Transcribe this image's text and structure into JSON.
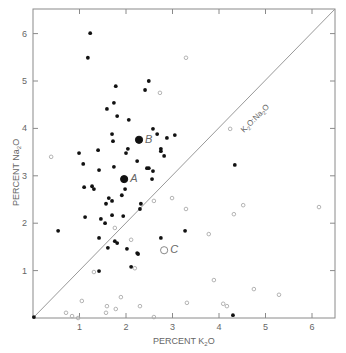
{
  "chart_data": {
    "type": "scatter",
    "title": "",
    "xlabel": "PERCENT  K2O",
    "ylabel": "PERCENT  Na2O",
    "xlabel_main": "PERCENT  K",
    "xlabel_sub": "2",
    "xlabel_end": "O",
    "ylabel_main": "PERCENT  Na",
    "ylabel_sub": "2",
    "ylabel_end": "O",
    "xlim": [
      0,
      6.5
    ],
    "ylim": [
      0,
      6.45
    ],
    "xticks": [
      1,
      2,
      3,
      4,
      5,
      6
    ],
    "yticks": [
      1,
      2,
      3,
      4,
      5,
      6
    ],
    "grid": false,
    "reference_line": {
      "label": "K2O:Na2O",
      "label_main": "K",
      "from": [
        0,
        0
      ],
      "to": [
        6.5,
        6.45
      ]
    },
    "series": [
      {
        "name": "filled",
        "marker": "filled-circle",
        "points": [
          [
            1.23,
            6.01
          ],
          [
            1.18,
            5.49
          ],
          [
            1.78,
            4.89
          ],
          [
            2.49,
            5.0
          ],
          [
            2.41,
            4.81
          ],
          [
            1.74,
            4.54
          ],
          [
            1.59,
            4.41
          ],
          [
            1.81,
            4.26
          ],
          [
            2.06,
            4.18
          ],
          [
            1.7,
            3.88
          ],
          [
            1.72,
            3.73
          ],
          [
            2.58,
            3.99
          ],
          [
            2.67,
            3.88
          ],
          [
            2.88,
            3.8
          ],
          [
            3.05,
            3.86
          ],
          [
            2.75,
            3.57
          ],
          [
            2.75,
            3.52
          ],
          [
            2.82,
            3.42
          ],
          [
            0.99,
            3.48
          ],
          [
            1.4,
            3.54
          ],
          [
            2.04,
            3.57
          ],
          [
            2.0,
            3.48
          ],
          [
            1.08,
            3.25
          ],
          [
            1.42,
            3.12
          ],
          [
            1.74,
            3.19
          ],
          [
            2.24,
            3.31
          ],
          [
            2.45,
            3.16
          ],
          [
            2.49,
            3.16
          ],
          [
            2.58,
            3.1
          ],
          [
            2.56,
            2.93
          ],
          [
            1.1,
            2.76
          ],
          [
            1.27,
            2.78
          ],
          [
            1.31,
            2.72
          ],
          [
            1.98,
            2.72
          ],
          [
            1.91,
            2.59
          ],
          [
            1.63,
            2.53
          ],
          [
            1.57,
            2.41
          ],
          [
            1.7,
            2.47
          ],
          [
            2.32,
            2.41
          ],
          [
            2.3,
            2.3
          ],
          [
            1.12,
            2.13
          ],
          [
            1.46,
            2.09
          ],
          [
            1.55,
            2.0
          ],
          [
            1.7,
            2.17
          ],
          [
            1.94,
            2.15
          ],
          [
            0.54,
            1.84
          ],
          [
            1.42,
            1.69
          ],
          [
            1.76,
            1.62
          ],
          [
            1.81,
            1.58
          ],
          [
            1.61,
            1.48
          ],
          [
            2.02,
            1.46
          ],
          [
            2.24,
            1.37
          ],
          [
            2.75,
            1.69
          ],
          [
            3.27,
            1.84
          ],
          [
            4.34,
            3.23
          ],
          [
            1.42,
            0.99
          ],
          [
            2.11,
            1.08
          ],
          [
            2.26,
            1.35
          ],
          [
            0.02,
            0.02
          ],
          [
            4.3,
            0.06
          ]
        ]
      },
      {
        "name": "open",
        "marker": "open-circle",
        "points": [
          [
            0.39,
            3.4
          ],
          [
            2.73,
            4.75
          ],
          [
            3.29,
            5.49
          ],
          [
            4.24,
            3.99
          ],
          [
            2.6,
            2.47
          ],
          [
            2.99,
            2.53
          ],
          [
            3.29,
            2.3
          ],
          [
            1.76,
            1.9
          ],
          [
            2.11,
            1.65
          ],
          [
            1.31,
            0.97
          ],
          [
            2.19,
            1.05
          ],
          [
            3.78,
            1.77
          ],
          [
            4.32,
            2.19
          ],
          [
            4.52,
            2.38
          ],
          [
            6.15,
            2.34
          ],
          [
            3.89,
            0.8
          ],
          [
            4.75,
            0.61
          ],
          [
            5.29,
            0.49
          ],
          [
            1.05,
            0.36
          ],
          [
            1.89,
            0.44
          ],
          [
            1.59,
            0.25
          ],
          [
            1.78,
            0.19
          ],
          [
            1.57,
            0.11
          ],
          [
            2.3,
            0.25
          ],
          [
            3.31,
            0.32
          ],
          [
            4.09,
            0.3
          ],
          [
            4.17,
            0.25
          ],
          [
            2.6,
            0.02
          ],
          [
            0.71,
            0.11
          ],
          [
            0.84,
            0.04
          ],
          [
            0.97,
            0.0
          ]
        ]
      },
      {
        "name": "labeled",
        "points": [
          {
            "label": "A",
            "x": 1.96,
            "y": 2.93,
            "marker": "large-filled-circle"
          },
          {
            "label": "B",
            "x": 2.28,
            "y": 3.76,
            "marker": "large-filled-circle"
          },
          {
            "label": "C",
            "x": 2.82,
            "y": 1.43,
            "marker": "large-open-circle"
          }
        ]
      }
    ]
  }
}
